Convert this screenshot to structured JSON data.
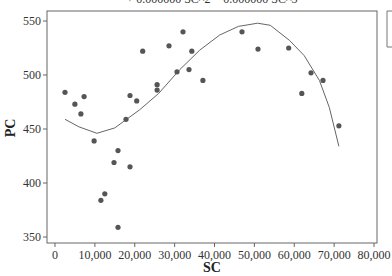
{
  "chart_data": {
    "type": "scatter",
    "title": "+ 0.000000 SC^2 − 0.000000 SC^3",
    "xlabel": "SC",
    "ylabel": "PC",
    "xlim": [
      0,
      80000
    ],
    "ylim": [
      350,
      550
    ],
    "xticks": [
      "0",
      "10,000",
      "20,000",
      "30,000",
      "40,000",
      "50,000",
      "60,000",
      "70,000",
      "80,000"
    ],
    "xtick_values": [
      0,
      10000,
      20000,
      30000,
      40000,
      50000,
      60000,
      70000,
      80000
    ],
    "yticks": [
      "350",
      "400",
      "450",
      "500",
      "550"
    ],
    "ytick_values": [
      350,
      400,
      450,
      500,
      550
    ],
    "grid": false,
    "legend_position": "right (cropped)",
    "series": [
      {
        "name": "PC",
        "kind": "scatter",
        "color": "#555555",
        "x": [
          2500,
          5000,
          6500,
          7300,
          9800,
          11500,
          12500,
          14800,
          15800,
          15800,
          17800,
          18800,
          18800,
          20500,
          22000,
          25600,
          25600,
          28600,
          30600,
          32100,
          33600,
          34300,
          37100,
          46900,
          50900,
          58600,
          61900,
          64200,
          67200,
          71200
        ],
        "y": [
          484,
          473,
          464,
          480,
          439,
          384,
          390,
          419,
          430,
          359,
          459,
          481,
          415,
          476,
          522,
          486,
          491,
          527,
          503,
          540,
          505,
          522,
          495,
          540,
          524,
          525,
          483,
          502,
          495,
          453
        ]
      },
      {
        "name": "Cubic fit",
        "kind": "line",
        "color": "#666666",
        "x": [
          2500,
          6000,
          10500,
          15000,
          21300,
          26000,
          31300,
          36300,
          41300,
          46000,
          50800,
          54000,
          58800,
          62500,
          66300,
          68800,
          71200
        ],
        "y": [
          459,
          452,
          446,
          451,
          468,
          483,
          505,
          523,
          537,
          545,
          548,
          546,
          532,
          518,
          495,
          470,
          434
        ]
      }
    ]
  },
  "labels": {
    "equation": "+ 0.000000 SC^2 − 0.000000 SC^3",
    "x_axis_title": "SC",
    "y_axis_title": "PC"
  }
}
